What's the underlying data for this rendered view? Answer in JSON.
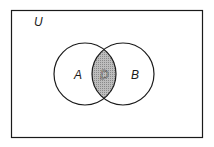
{
  "diagram": {
    "type": "venn",
    "universe_label": "U",
    "sets": [
      {
        "label": "A"
      },
      {
        "label": "B"
      }
    ],
    "intersection_label": "D",
    "colors": {
      "stroke": "#1a1a1a",
      "intersection_fill": "#a8a8a8",
      "background": "#ffffff"
    }
  }
}
